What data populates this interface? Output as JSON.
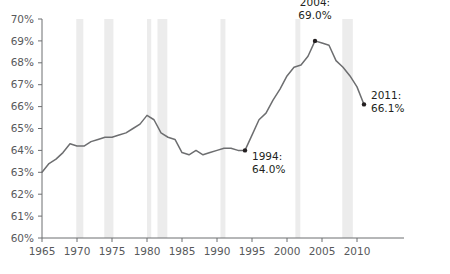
{
  "chart_data": {
    "type": "line",
    "title": "",
    "subtitle": "",
    "xlabel": "",
    "ylabel": "",
    "xlim": [
      1965,
      2011
    ],
    "ylim": [
      60,
      70
    ],
    "grid": false,
    "legend": "none",
    "x_tick_labels": [
      "1965",
      "1970",
      "1975",
      "1980",
      "1985",
      "1990",
      "1995",
      "2000",
      "2005",
      "2010"
    ],
    "x_ticks": [
      1965,
      1970,
      1975,
      1980,
      1985,
      1990,
      1995,
      2000,
      2005,
      2010
    ],
    "y_tick_labels": [
      "60%",
      "61%",
      "62%",
      "63%",
      "64%",
      "65%",
      "66%",
      "67%",
      "68%",
      "69%",
      "70%"
    ],
    "y_ticks": [
      60,
      61,
      62,
      63,
      64,
      65,
      66,
      67,
      68,
      69,
      70
    ],
    "series": [
      {
        "name": "Homeownership rate",
        "color": "#6d6e70",
        "x": [
          1965,
          1966,
          1967,
          1968,
          1969,
          1970,
          1971,
          1972,
          1973,
          1974,
          1975,
          1976,
          1977,
          1978,
          1979,
          1980,
          1981,
          1982,
          1983,
          1984,
          1985,
          1986,
          1987,
          1988,
          1989,
          1990,
          1991,
          1992,
          1993,
          1994,
          1995,
          1996,
          1997,
          1998,
          1999,
          2000,
          2001,
          2002,
          2003,
          2004,
          2005,
          2006,
          2007,
          2008,
          2009,
          2010,
          2011
        ],
        "values": [
          63.0,
          63.4,
          63.6,
          63.9,
          64.3,
          64.2,
          64.2,
          64.4,
          64.5,
          64.6,
          64.6,
          64.7,
          64.8,
          65.0,
          65.2,
          65.6,
          65.4,
          64.8,
          64.6,
          64.5,
          63.9,
          63.8,
          64.0,
          63.8,
          63.9,
          64.0,
          64.1,
          64.1,
          64.0,
          64.0,
          64.7,
          65.4,
          65.7,
          66.3,
          66.8,
          67.4,
          67.8,
          67.9,
          68.3,
          69.0,
          68.9,
          68.8,
          68.1,
          67.8,
          67.4,
          66.9,
          66.1
        ]
      }
    ],
    "recession_bands": [
      {
        "start": 1969.9,
        "end": 1970.9
      },
      {
        "start": 1973.9,
        "end": 1975.2
      },
      {
        "start": 1980.0,
        "end": 1980.6
      },
      {
        "start": 1981.5,
        "end": 1982.9
      },
      {
        "start": 1990.5,
        "end": 1991.2
      },
      {
        "start": 2001.2,
        "end": 2001.9
      },
      {
        "start": 2007.9,
        "end": 2009.4
      }
    ],
    "recession_band_color": "#ececec",
    "axis_color": "#6d6e70",
    "annotations": [
      {
        "name": "annotation-1994",
        "line1": "1994:",
        "line2": "64.0%",
        "point_x": 1994,
        "point_y": 64.0,
        "label_x": 1995.0,
        "label_y": 63.55,
        "marker": true
      },
      {
        "name": "annotation-2004",
        "line1": "2004:",
        "line2": "69.0%",
        "point_x": 2004,
        "point_y": 69.0,
        "label_x": 2004.0,
        "label_y": 70.6,
        "marker": true
      },
      {
        "name": "annotation-2011",
        "line1": "2011:",
        "line2": "66.1%",
        "point_x": 2011,
        "point_y": 66.1,
        "label_x": 2012.0,
        "label_y": 66.35,
        "marker": true
      }
    ]
  }
}
